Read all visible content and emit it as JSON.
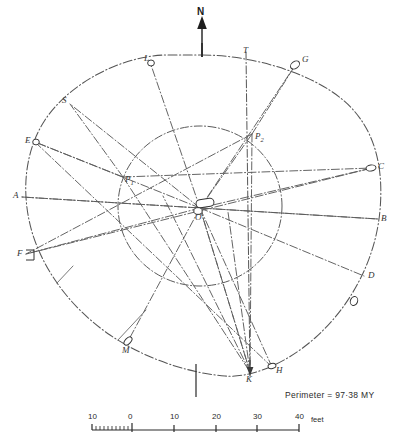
{
  "figure": {
    "type": "archaeological-survey-plan",
    "north_label": "N",
    "perimeter_note": "Perimeter = 97·38 MY",
    "center_label": "O"
  },
  "stones": [
    {
      "id": "L",
      "label": "L",
      "x": 150,
      "y": 62,
      "lx": 144,
      "ly": 54,
      "marker": "small-ring"
    },
    {
      "id": "T",
      "label": "T",
      "x": 247,
      "y": 57,
      "lx": 243,
      "ly": 46,
      "marker": "none"
    },
    {
      "id": "G",
      "label": "G",
      "x": 296,
      "y": 64,
      "lx": 302,
      "ly": 55,
      "marker": "stone"
    },
    {
      "id": "S",
      "label": "S",
      "x": 70,
      "y": 104,
      "lx": 62,
      "ly": 96,
      "marker": "none"
    },
    {
      "id": "E",
      "label": "E",
      "x": 35,
      "y": 142,
      "lx": 25,
      "ly": 136,
      "marker": "small-ring"
    },
    {
      "id": "C",
      "label": "C",
      "x": 372,
      "y": 168,
      "lx": 378,
      "ly": 162,
      "marker": "stone"
    },
    {
      "id": "A",
      "label": "A",
      "x": 22,
      "y": 197,
      "lx": 13,
      "ly": 191,
      "marker": "none"
    },
    {
      "id": "B",
      "label": "B",
      "x": 378,
      "y": 219,
      "lx": 381,
      "ly": 214,
      "marker": "none"
    },
    {
      "id": "F",
      "label": "F",
      "x": 26,
      "y": 254,
      "lx": 17,
      "ly": 249,
      "marker": "stone-rect"
    },
    {
      "id": "D",
      "label": "D",
      "x": 364,
      "y": 276,
      "lx": 368,
      "ly": 271,
      "marker": "none"
    },
    {
      "id": "M",
      "label": "M",
      "x": 127,
      "y": 343,
      "lx": 122,
      "ly": 346,
      "marker": "stone"
    },
    {
      "id": "K",
      "label": "K",
      "x": 250,
      "y": 372,
      "lx": 246,
      "ly": 375,
      "marker": "none"
    },
    {
      "id": "H",
      "label": "H",
      "x": 272,
      "y": 367,
      "lx": 276,
      "ly": 366,
      "marker": "stone"
    }
  ],
  "foci": [
    {
      "id": "P1",
      "label": "P",
      "sub": "1",
      "x": 123,
      "y": 177,
      "lx": 125,
      "ly": 175
    },
    {
      "id": "P2",
      "label": "P",
      "sub": "2",
      "x": 252,
      "y": 134,
      "lx": 255,
      "ly": 132
    }
  ],
  "scale_bar": {
    "ticks": [
      "10",
      "0",
      "10",
      "20",
      "30",
      "40"
    ],
    "tick_x": [
      92,
      132,
      174,
      216,
      257,
      299
    ],
    "units": "feet",
    "baseline_y": 430,
    "label_y": 412
  },
  "colors": {
    "ink": "#3a3a3a",
    "light_ink": "#6b6b6b",
    "solid": "#222222",
    "paper": "#ffffff"
  }
}
